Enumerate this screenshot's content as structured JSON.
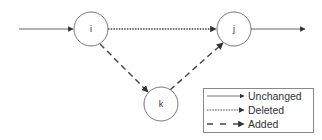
{
  "diagram": {
    "nodes": [
      {
        "id": "i",
        "label": "i",
        "cx": 91,
        "cy": 29,
        "r": 17
      },
      {
        "id": "j",
        "label": "j",
        "cx": 234,
        "cy": 29,
        "r": 17
      },
      {
        "id": "k",
        "label": "k",
        "cx": 161,
        "cy": 104,
        "r": 17
      }
    ],
    "edges": [
      {
        "from": "source",
        "to": "i",
        "style": "unchanged"
      },
      {
        "from": "i",
        "to": "j",
        "style": "deleted"
      },
      {
        "from": "i",
        "to": "k",
        "style": "added"
      },
      {
        "from": "k",
        "to": "j",
        "style": "added"
      },
      {
        "from": "j",
        "to": "sink",
        "style": "unchanged"
      }
    ],
    "colors": {
      "line": "#555555",
      "node_stroke": "#777777",
      "legend_border": "#888888"
    }
  },
  "legend": {
    "items": [
      {
        "style": "unchanged",
        "label": "Unchanged"
      },
      {
        "style": "deleted",
        "label": "Deleted"
      },
      {
        "style": "added",
        "label": "Added"
      }
    ]
  }
}
